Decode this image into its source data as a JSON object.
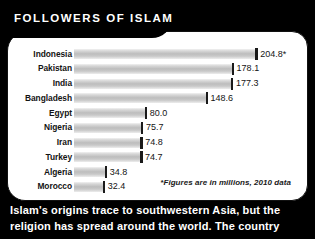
{
  "header": {
    "title": "FOLLOWERS OF ISLAM"
  },
  "footnote": "*Figures are in millions, 2010 data",
  "caption": {
    "line1": "Islam's origins trace to southwestern Asia, but the",
    "line2": "religion has spread around the world. The country"
  },
  "colors": {
    "background": "#000000",
    "panel": "#ffffff",
    "bar": "#bdbdbd",
    "bar_cap": "#1a1a1a",
    "text": "#131313",
    "header_text": "#ffffff"
  },
  "chart_data": {
    "type": "bar",
    "orientation": "horizontal",
    "title": "FOLLOWERS OF ISLAM",
    "xlabel": "",
    "ylabel": "",
    "grid": false,
    "legend": "none",
    "note": "*Figures are in millions, 2010 data",
    "units": "millions",
    "year": 2010,
    "xlim": [
      0,
      210
    ],
    "categories": [
      "Indonesia",
      "Pakistan",
      "India",
      "Bangladesh",
      "Egypt",
      "Nigeria",
      "Iran",
      "Turkey",
      "Algeria",
      "Morocco"
    ],
    "values": [
      204.8,
      178.1,
      177.3,
      148.6,
      80.0,
      75.7,
      74.8,
      74.7,
      34.8,
      32.4
    ],
    "value_labels": [
      "204.8*",
      "178.1",
      "177.3",
      "148.6",
      "80.0",
      "75.7",
      "74.8",
      "74.7",
      "34.8",
      "32.4"
    ],
    "rows": [
      {
        "label": "Indonesia",
        "value": 204.8,
        "display": "204.8*"
      },
      {
        "label": "Pakistan",
        "value": 178.1,
        "display": "178.1"
      },
      {
        "label": "India",
        "value": 177.3,
        "display": "177.3"
      },
      {
        "label": "Bangladesh",
        "value": 148.6,
        "display": "148.6"
      },
      {
        "label": "Egypt",
        "value": 80.0,
        "display": "80.0"
      },
      {
        "label": "Nigeria",
        "value": 75.7,
        "display": "75.7"
      },
      {
        "label": "Iran",
        "value": 74.8,
        "display": "74.8"
      },
      {
        "label": "Turkey",
        "value": 74.7,
        "display": "74.7"
      },
      {
        "label": "Algeria",
        "value": 34.8,
        "display": "34.8"
      },
      {
        "label": "Morocco",
        "value": 32.4,
        "display": "32.4"
      }
    ]
  }
}
